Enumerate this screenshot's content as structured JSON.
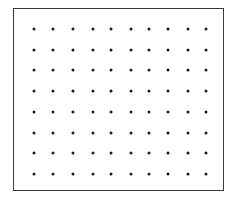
{
  "diagram": {
    "type": "dot-grid",
    "frame": {
      "left": 13,
      "top": 8,
      "right": 225,
      "bottom": 192,
      "stroke_color": "#3a3a3a"
    },
    "dot_color": "#1a1a1a",
    "rows": 8,
    "columns": 10,
    "row_positions": [
      29,
      50,
      70,
      91,
      112,
      133,
      153,
      174
    ],
    "column_positions": [
      34,
      53,
      73,
      93,
      111,
      131,
      149,
      168,
      188,
      206
    ]
  }
}
